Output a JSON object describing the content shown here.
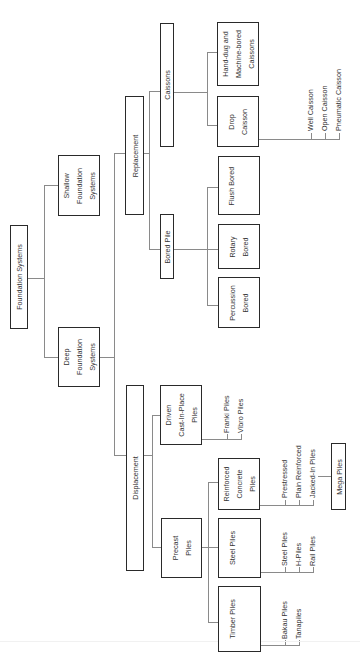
{
  "diagram": {
    "title": "Foundation Systems",
    "orientation": "rotated-90-ccw",
    "nodes": {
      "root": "Foundation Systems",
      "shallow": "Shallow\nFoundation\nSystems",
      "deep": "Deep\nFoundation\nSystems",
      "replacement": "Replacement",
      "displacement": "Displacement",
      "caissons": "Caissons",
      "bored_pile": "Bored Pile",
      "hand_dug": "Hand-dug and\nMachine-bored\nCaissons",
      "drop_caisson": "Drop\nCaisson",
      "flush_bored": "Flush Bored",
      "rotary_bored": "Rotary\nBored",
      "percussion_bored": "Percussion\nBored",
      "driven_cip": "Driven\nCast-In-Place\nPiles",
      "precast": "Precast\nPiles",
      "reinforced_concrete": "Reinforced\nConcrete\nPiles",
      "steel": "Steel Piles",
      "timber": "Timber Piles",
      "mega": "Mega Piles"
    },
    "leaves": {
      "drop_caisson": [
        "Well Caisson",
        "Open Caisson",
        "Pneumatic Caisson"
      ],
      "driven_cip": [
        "Franki Piles",
        "Vibro Piles"
      ],
      "reinforced_concrete": [
        "Prestressed",
        "Plain Reinforced",
        "Jacked-In Piles"
      ],
      "steel": [
        "Steel Piles",
        "H-Piles",
        "Rail Piles"
      ],
      "timber": [
        "Bakau Piles",
        "Tanapiles"
      ]
    },
    "colors": {
      "box_border": "#2a2a2a",
      "connector": "#8a8a8a",
      "text": "#333333",
      "background": "#ffffff"
    }
  }
}
